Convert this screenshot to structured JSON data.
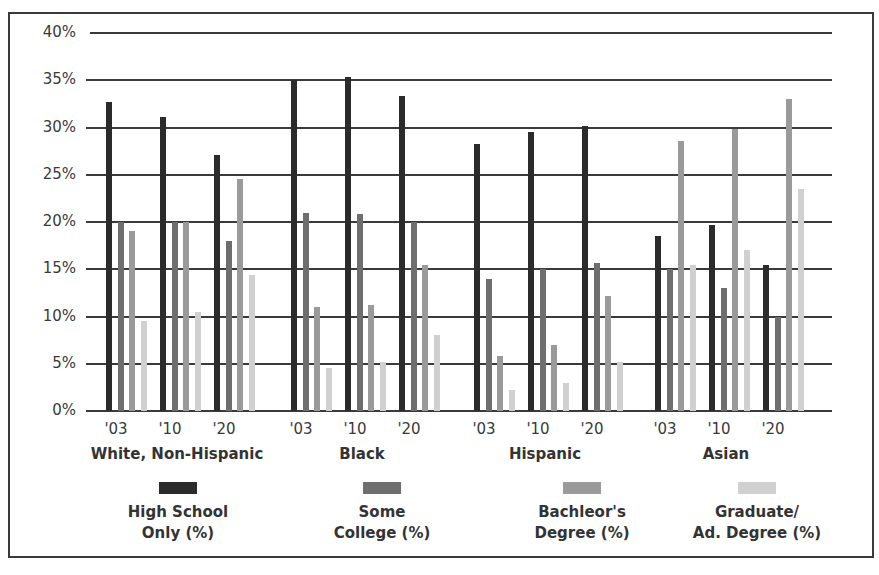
{
  "chart_data": {
    "type": "bar",
    "title": "",
    "xlabel": "",
    "ylabel": "",
    "ylim": [
      0,
      40
    ],
    "yticks": [
      "0%",
      "5%",
      "10%",
      "15%",
      "20%",
      "25%",
      "30%",
      "35%",
      "40%"
    ],
    "grid": true,
    "legend_position": "bottom",
    "groups": [
      "White, Non-Hispanic",
      "Black",
      "Hispanic",
      "Asian"
    ],
    "years": [
      "'03",
      "'10",
      "'20"
    ],
    "categories": [
      "White, Non-Hispanic '03",
      "White, Non-Hispanic '10",
      "White, Non-Hispanic '20",
      "Black '03",
      "Black '10",
      "Black '20",
      "Hispanic '03",
      "Hispanic '10",
      "Hispanic '20",
      "Asian '03",
      "Asian '10",
      "Asian '20"
    ],
    "series": [
      {
        "name": "High School Only (%)",
        "color": "#2b2b2b",
        "values": [
          32.7,
          31.1,
          27.1,
          35.0,
          35.3,
          33.3,
          28.3,
          29.5,
          30.2,
          18.5,
          19.7,
          15.5
        ]
      },
      {
        "name": "Some College (%)",
        "color": "#6e6e6e",
        "values": [
          20.0,
          20.0,
          18.0,
          20.9,
          20.8,
          20.0,
          14.0,
          15.0,
          15.7,
          15.0,
          13.0,
          10.0
        ]
      },
      {
        "name": "Bachleor's Degree (%)",
        "color": "#9a9a9a",
        "values": [
          19.0,
          20.0,
          24.5,
          11.0,
          11.2,
          15.4,
          5.8,
          7.0,
          12.2,
          28.6,
          29.8,
          33.0
        ]
      },
      {
        "name": "Graduate/ Ad. Degree (%)",
        "color": "#d0d0d0",
        "values": [
          9.5,
          10.5,
          14.4,
          4.5,
          5.2,
          8.0,
          2.2,
          3.0,
          5.2,
          15.4,
          17.0,
          23.5
        ]
      }
    ]
  },
  "legend": [
    {
      "label": "High School\nOnly (%)",
      "color": "#2b2b2b"
    },
    {
      "label": "Some\nCollege (%)",
      "color": "#6e6e6e"
    },
    {
      "label": "Bachleor's\nDegree (%)",
      "color": "#9a9a9a"
    },
    {
      "label": "Graduate/\nAd. Degree (%)",
      "color": "#d0d0d0"
    }
  ]
}
